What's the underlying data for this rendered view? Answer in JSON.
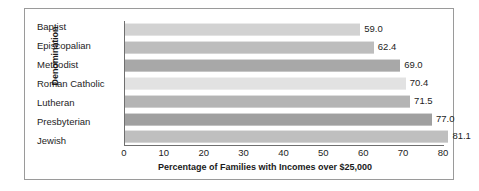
{
  "chart_data": {
    "type": "bar",
    "orientation": "horizontal",
    "title": "",
    "xlabel": "Percentage of Families with Incomes over $25,000",
    "ylabel": "Denomination",
    "categories": [
      "Baptist",
      "Episcopalian",
      "Methodist",
      "Roman Catholic",
      "Lutheran",
      "Presbyterian",
      "Jewish"
    ],
    "values": [
      59.0,
      62.4,
      69.0,
      70.4,
      71.5,
      77.0,
      81.1
    ],
    "value_labels": [
      "59.0",
      "62.4",
      "69.0",
      "70.4",
      "71.5",
      "77.0",
      "81.1"
    ],
    "bar_colors": [
      "#d2d2d2",
      "#bdbdbd",
      "#a8a8a8",
      "#e2e2e2",
      "#b4b4b4",
      "#a0a0a0",
      "#bfbfbf"
    ],
    "xlim": [
      0,
      80
    ],
    "xticks": [
      0,
      10,
      20,
      30,
      40,
      50,
      60,
      70,
      80
    ],
    "xtick_labels": [
      "0",
      "10",
      "20",
      "30",
      "40",
      "50",
      "60",
      "70",
      "80"
    ],
    "grid": false,
    "legend": false,
    "axis_color": "#6f6f6f",
    "border_color": "#9a9a9a",
    "background": "#ffffff"
  }
}
